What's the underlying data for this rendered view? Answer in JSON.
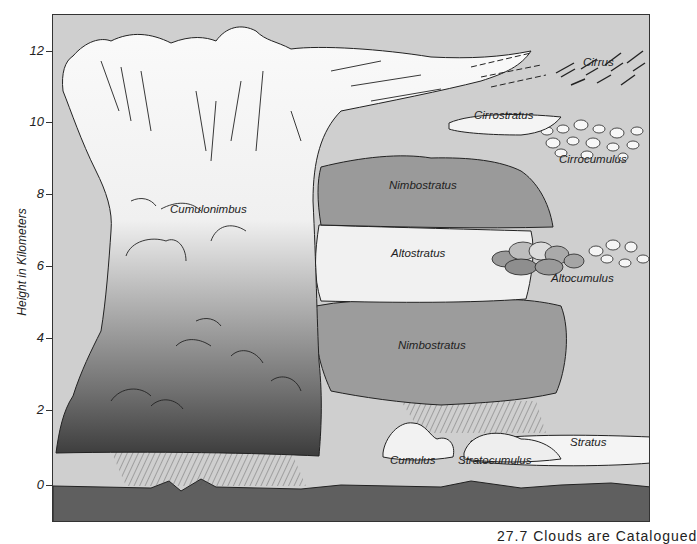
{
  "figure": {
    "y_axis": {
      "label": "Height in Kilometers",
      "ticks": [
        {
          "value": "12",
          "y": 51
        },
        {
          "value": "10",
          "y": 122
        },
        {
          "value": "8",
          "y": 194
        },
        {
          "value": "6",
          "y": 266
        },
        {
          "value": "4",
          "y": 338
        },
        {
          "value": "2",
          "y": 410
        },
        {
          "value": "0",
          "y": 485
        }
      ]
    },
    "clouds": [
      {
        "name": "Cirrus",
        "x": 583,
        "y": 63
      },
      {
        "name": "Cirrostratus",
        "x": 474,
        "y": 116
      },
      {
        "name": "Cirrocumulus",
        "x": 559,
        "y": 160
      },
      {
        "name": "Nimbostratus",
        "x": 389,
        "y": 186
      },
      {
        "name": "Cumulonimbus",
        "x": 170,
        "y": 210
      },
      {
        "name": "Altostratus",
        "x": 391,
        "y": 254
      },
      {
        "name": "Altocumulus",
        "x": 551,
        "y": 279
      },
      {
        "name": "Nimbostratus",
        "x": 398,
        "y": 346
      },
      {
        "name": "Stratus",
        "x": 570,
        "y": 443
      },
      {
        "name": "Cumulus",
        "x": 390,
        "y": 461
      },
      {
        "name": "Stratocumulus",
        "x": 458,
        "y": 461
      }
    ],
    "colors": {
      "sky": "#cfcfcf",
      "ground": "#5f5f5f",
      "cloud_white": "#f8f8f8",
      "cloud_dark": "#3a3a3a",
      "nimbostratus": "#9a9a9a",
      "outline": "#222222"
    }
  },
  "caption": {
    "text": "27.7  Clouds are Catalogued"
  }
}
